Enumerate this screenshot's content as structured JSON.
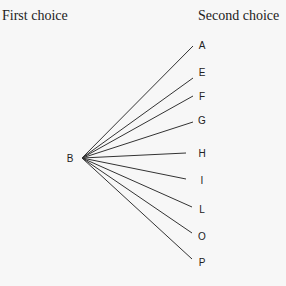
{
  "headers": {
    "left": "First choice",
    "right": "Second choice"
  },
  "root": {
    "label": "B",
    "x": 82,
    "y": 158,
    "label_x": 70,
    "label_y": 158
  },
  "branches": [
    {
      "label": "A",
      "ex": 193,
      "ey": 46,
      "lx": 202,
      "ly": 45
    },
    {
      "label": "E",
      "ex": 193,
      "ey": 78,
      "lx": 202,
      "ly": 72
    },
    {
      "label": "F",
      "ex": 193,
      "ey": 96,
      "lx": 202,
      "ly": 96
    },
    {
      "label": "G",
      "ex": 193,
      "ey": 122,
      "lx": 202,
      "ly": 120
    },
    {
      "label": "H",
      "ex": 186,
      "ey": 153,
      "lx": 202,
      "ly": 153
    },
    {
      "label": "I",
      "ex": 186,
      "ey": 179,
      "lx": 202,
      "ly": 180
    },
    {
      "label": "L",
      "ex": 192,
      "ey": 207,
      "lx": 202,
      "ly": 209
    },
    {
      "label": "O",
      "ex": 192,
      "ey": 233,
      "lx": 202,
      "ly": 236
    },
    {
      "label": "P",
      "ex": 192,
      "ey": 259,
      "lx": 202,
      "ly": 262
    }
  ]
}
